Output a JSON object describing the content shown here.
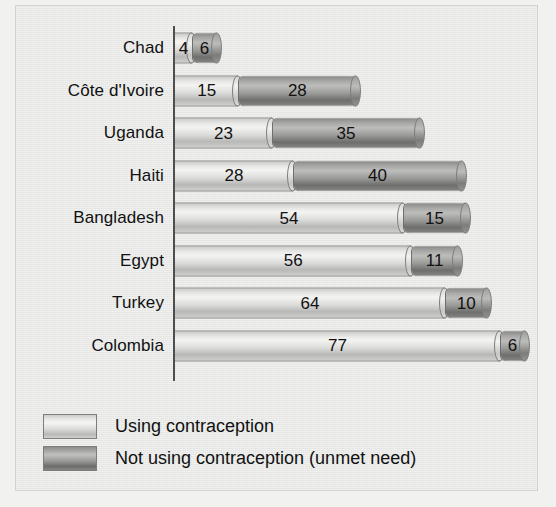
{
  "chart_data": {
    "type": "bar",
    "subtype": "stacked-horizontal-cylinder",
    "title": "",
    "xlabel": "",
    "ylabel": "",
    "xlim": [
      0,
      83
    ],
    "grid": false,
    "axis": "vertical category axis at left",
    "categories": [
      "Chad",
      "Côte d'Ivoire",
      "Uganda",
      "Haiti",
      "Bangladesh",
      "Egypt",
      "Turkey",
      "Colombia"
    ],
    "series": [
      {
        "name": "Using contraception",
        "color": "#dcdcda",
        "values": [
          4,
          15,
          23,
          28,
          54,
          56,
          64,
          77
        ]
      },
      {
        "name": "Not using contraception (unmet need)",
        "color": "#9a9a98",
        "values": [
          6,
          28,
          35,
          40,
          15,
          11,
          10,
          6
        ]
      }
    ],
    "legend": {
      "position": "bottom-left",
      "entries": [
        "Using contraception",
        "Not using contraception (unmet need)"
      ]
    },
    "rows": [
      {
        "label": "Chad",
        "using": 4,
        "unmet": 6
      },
      {
        "label": "Côte d'Ivoire",
        "using": 15,
        "unmet": 28
      },
      {
        "label": "Uganda",
        "using": 23,
        "unmet": 35
      },
      {
        "label": "Haiti",
        "using": 28,
        "unmet": 40
      },
      {
        "label": "Bangladesh",
        "using": 54,
        "unmet": 15
      },
      {
        "label": "Egypt",
        "using": 56,
        "unmet": 11
      },
      {
        "label": "Turkey",
        "using": 64,
        "unmet": 10
      },
      {
        "label": "Colombia",
        "using": 77,
        "unmet": 6
      }
    ]
  },
  "legend": {
    "items": [
      {
        "key": "light",
        "label": "Using contraception"
      },
      {
        "key": "dark",
        "label": "Not using contraception (unmet need)"
      }
    ]
  },
  "colors": {
    "background": "#e9e9e8",
    "axis": "#4e4e4e",
    "text": "#111111",
    "series_light": "#dcdcda",
    "series_dark": "#9a9a98"
  }
}
